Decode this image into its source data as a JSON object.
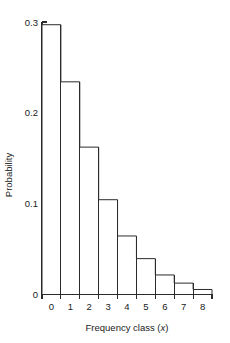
{
  "chart_data": {
    "type": "bar",
    "title": "",
    "subtitle": "",
    "xlabel": "Frequency class (x)",
    "xlabel_prefix": "Frequency class (",
    "xlabel_italic": "x",
    "xlabel_suffix": ")",
    "ylabel": "Probability",
    "categories": [
      "0",
      "1",
      "2",
      "3",
      "4",
      "5",
      "6",
      "7",
      "8"
    ],
    "values": [
      0.297,
      0.234,
      0.162,
      0.104,
      0.064,
      0.039,
      0.021,
      0.012,
      0.005
    ],
    "series": [
      {
        "name": "Probability",
        "values": [
          0.297,
          0.234,
          0.162,
          0.104,
          0.064,
          0.039,
          0.021,
          0.012,
          0.005
        ]
      }
    ],
    "xlim": [
      -0.5,
      8.5
    ],
    "ylim": [
      0,
      0.3
    ],
    "ytick_values": [
      0,
      0.1,
      0.2,
      0.3
    ],
    "ytick_labels": [
      "0",
      "0.1",
      "0.2",
      "0.3"
    ],
    "xtick_labels": [
      "0",
      "1",
      "2",
      "3",
      "4",
      "5",
      "6",
      "7",
      "8"
    ],
    "grid": false,
    "legend": false,
    "legend_position": "none",
    "bar_fill": "#ffffff",
    "bar_stroke": "#2b2b2b",
    "axis_color": "#2b2b2b",
    "background": "#ffffff"
  }
}
